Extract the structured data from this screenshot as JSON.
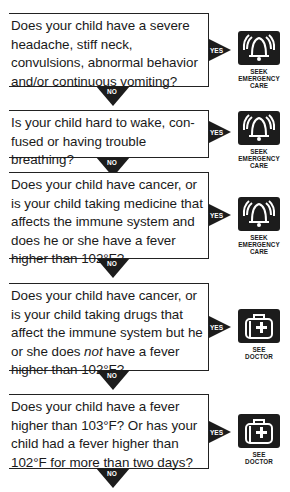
{
  "flowchart": {
    "steps": [
      {
        "question": "Does your child have a severe headache, stiff neck, convulsions, abnormal behavior and/or continuous vomiting?",
        "yes_label": "YES",
        "no_label": "NO",
        "outcome": {
          "icon": "bell-icon",
          "line1": "SEEK",
          "line2": "EMERGENCY",
          "line3": "CARE"
        }
      },
      {
        "question": "Is your child hard to wake, confused or having trouble breathing?",
        "question_display": [
          "Is your child hard to wake, con-",
          "fused or having trouble breathing?"
        ],
        "yes_label": "YES",
        "no_label": "NO",
        "outcome": {
          "icon": "bell-icon",
          "line1": "SEEK",
          "line2": "EMERGENCY",
          "line3": "CARE"
        }
      },
      {
        "question": "Does your child have cancer, or is your child taking medicine that affects the immune system and does he or she have a fever higher than 102°F?",
        "yes_label": "YES",
        "no_label": "NO",
        "outcome": {
          "icon": "bell-icon",
          "line1": "SEEK",
          "line2": "EMERGENCY",
          "line3": "CARE"
        }
      },
      {
        "question_part1": "Does your child have cancer, or is your child taking drugs that affect the immune system but he or she does ",
        "question_emphasis": "not",
        "question_part2": " have a fever higher than 102°F?",
        "yes_label": "YES",
        "no_label": "NO",
        "outcome": {
          "icon": "medical-bag-icon",
          "line1": "SEE",
          "line2": "DOCTOR"
        }
      },
      {
        "question": "Does your child have a fever higher than 103°F? Or has your child had a fever higher than 102°F for more than two days?",
        "yes_label": "YES",
        "no_label": "NO",
        "outcome": {
          "icon": "medical-bag-icon",
          "line1": "SEE",
          "line2": "DOCTOR"
        }
      }
    ]
  }
}
